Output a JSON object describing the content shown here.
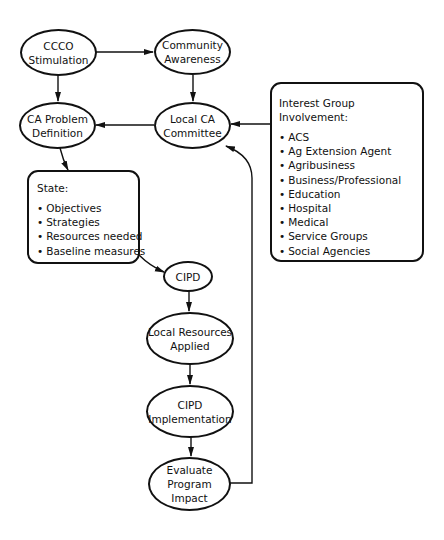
{
  "diagram": {
    "type": "flowchart",
    "nodes": {
      "ccco_stimulation": {
        "lines": [
          "CCCO",
          "Stimulation"
        ]
      },
      "community_awareness": {
        "lines": [
          "Community",
          "Awareness"
        ]
      },
      "ca_problem_definition": {
        "lines": [
          "CA Problem",
          "Definition"
        ]
      },
      "local_ca_committee": {
        "lines": [
          "Local CA",
          "Committee"
        ]
      },
      "state_box": {
        "title": "State:",
        "items": [
          "Objectives",
          "Strategies",
          "Resources needed",
          "Baseline measures"
        ]
      },
      "cipd": {
        "lines": [
          "CIPD"
        ]
      },
      "local_resources_applied": {
        "lines": [
          "Local Resources",
          "Applied"
        ]
      },
      "cipd_implementation": {
        "lines": [
          "CIPD",
          "Implementation"
        ]
      },
      "evaluate_program_impact": {
        "lines": [
          "Evaluate",
          "Program",
          "Impact"
        ]
      },
      "interest_group_box": {
        "title": "Interest Group Involvement:",
        "items": [
          "ACS",
          "Ag Extension Agent",
          "Agribusiness",
          "Business/Professional",
          "Education",
          "Hospital",
          "Medical",
          "Service Groups",
          "Social Agencies"
        ]
      }
    },
    "edges": [
      {
        "from": "CCCO Stimulation",
        "to": "Community Awareness"
      },
      {
        "from": "CCCO Stimulation",
        "to": "CA Problem Definition"
      },
      {
        "from": "Community Awareness",
        "to": "Local CA Committee"
      },
      {
        "from": "Local CA Committee",
        "to": "CA Problem Definition"
      },
      {
        "from": "Interest Group Involvement",
        "to": "Local CA Committee"
      },
      {
        "from": "CA Problem Definition",
        "to": "State"
      },
      {
        "from": "State",
        "to": "CIPD"
      },
      {
        "from": "CIPD",
        "to": "Local Resources Applied"
      },
      {
        "from": "Local Resources Applied",
        "to": "CIPD Implementation"
      },
      {
        "from": "CIPD Implementation",
        "to": "Evaluate Program Impact"
      },
      {
        "from": "Evaluate Program Impact",
        "to": "Local CA Committee"
      }
    ],
    "colors": {
      "line": "#111111",
      "background": "#ffffff"
    }
  }
}
